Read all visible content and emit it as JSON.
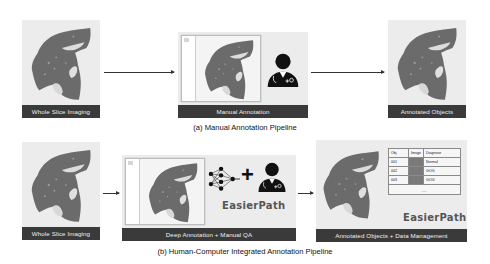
{
  "pipeline_a": {
    "caption": "(a) Manual Annotation Pipeline",
    "steps": [
      {
        "label": "Whole Slice Imaging",
        "icon": "tissue-slide-icon"
      },
      {
        "label": "Manual Annotation",
        "icon": "doctor-icon"
      },
      {
        "label": "Annotated Objects",
        "icon": "tissue-slide-icon"
      }
    ]
  },
  "pipeline_b": {
    "caption": "(b) Human-Computer Integrated Annotation Pipeline",
    "steps": [
      {
        "label": "Whole Slice Imaging",
        "icon": "tissue-slide-icon"
      },
      {
        "label": "Deep Annotation + Manual QA",
        "icon": "neural-network-icon",
        "operator": "+",
        "brand": "EasierPath"
      },
      {
        "label": "Annotated Objects + Data Management",
        "brand": "EasierPath",
        "table": {
          "headers": [
            "Obj",
            "Image",
            "Diagnose"
          ],
          "rows": [
            [
              "001",
              "",
              "Normal"
            ],
            [
              "002",
              "",
              "GOG"
            ],
            [
              "003",
              "",
              "GOG"
            ]
          ],
          "more": "…"
        }
      }
    ]
  },
  "colors": {
    "label_bar": "#3a3a3a",
    "tissue": "#6e6e6e",
    "panel_bg": "#ececec"
  }
}
